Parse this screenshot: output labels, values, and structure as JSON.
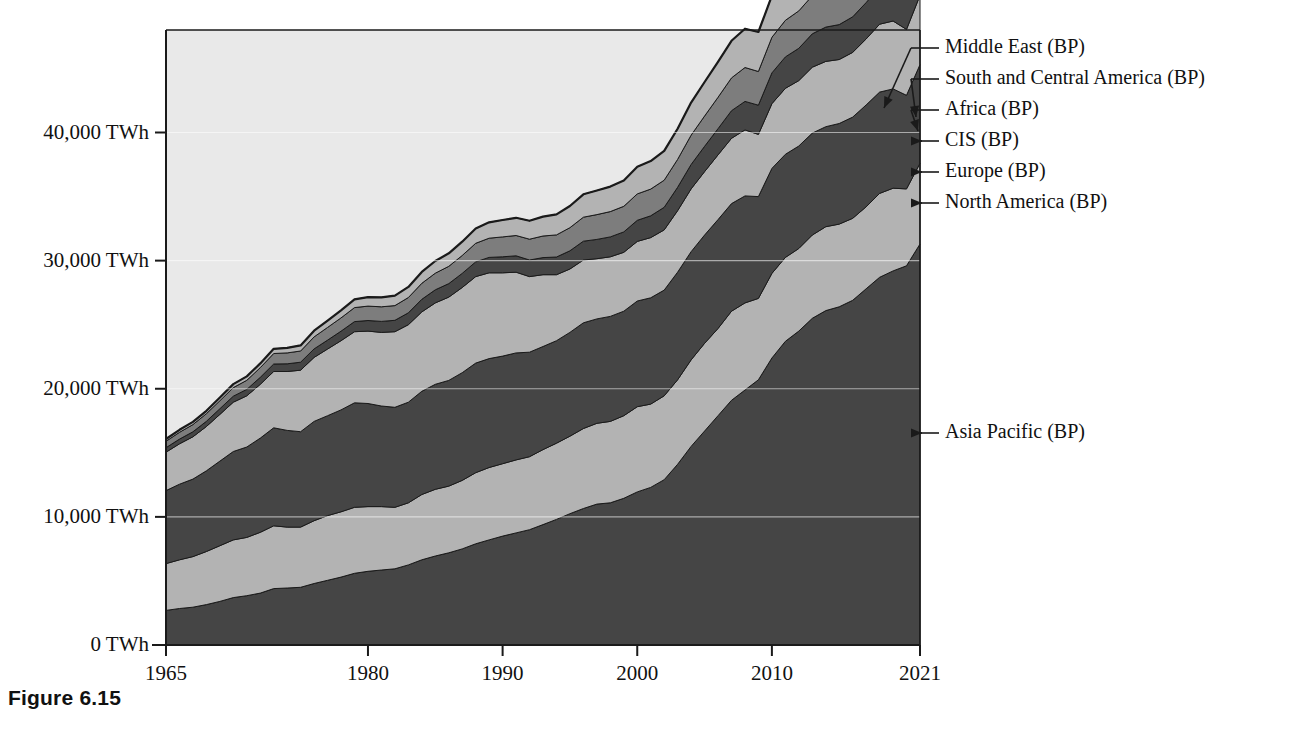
{
  "figure": {
    "caption": "Figure 6.15"
  },
  "axes": {
    "y_ticks": [
      {
        "label": "0 TWh",
        "value": 0
      },
      {
        "label": "10,000 TWh",
        "value": 10000
      },
      {
        "label": "20,000 TWh",
        "value": 20000
      },
      {
        "label": "30,000 TWh",
        "value": 30000
      },
      {
        "label": "40,000 TWh",
        "value": 40000
      }
    ],
    "x_ticks": [
      {
        "label": "1965",
        "value": 1965
      },
      {
        "label": "1980",
        "value": 1980
      },
      {
        "label": "1990",
        "value": 1990
      },
      {
        "label": "2000",
        "value": 2000
      },
      {
        "label": "2010",
        "value": 2010
      },
      {
        "label": "2021",
        "value": 2021
      }
    ]
  },
  "callouts": [
    {
      "id": "middle-east",
      "label": "Middle East (BP)"
    },
    {
      "id": "south-central-america",
      "label": "South and Central America (BP)"
    },
    {
      "id": "africa",
      "label": "Africa (BP)"
    },
    {
      "id": "cis",
      "label": "CIS (BP)"
    },
    {
      "id": "europe",
      "label": "Europe (BP)"
    },
    {
      "id": "north-america",
      "label": "North America (BP)"
    },
    {
      "id": "asia-pacific",
      "label": "Asia Pacific (BP)"
    }
  ],
  "colors": {
    "plot_background": "#e9e9e9",
    "dark_band": "#454545",
    "light_band": "#b3b3b3",
    "medium_band": "#7d7d7d",
    "outline": "#1a1a1a",
    "text": "#111111"
  },
  "chart_data": {
    "type": "area",
    "stacked": true,
    "title": "",
    "xlabel": "",
    "ylabel": "TWh",
    "xlim": [
      1965,
      2021
    ],
    "ylim": [
      0,
      48000
    ],
    "grid": false,
    "legend_position": "right-callouts",
    "units": "TWh",
    "x": [
      1965,
      1966,
      1967,
      1968,
      1969,
      1970,
      1971,
      1972,
      1973,
      1974,
      1975,
      1976,
      1977,
      1978,
      1979,
      1980,
      1981,
      1982,
      1983,
      1984,
      1985,
      1986,
      1987,
      1988,
      1989,
      1990,
      1991,
      1992,
      1993,
      1994,
      1995,
      1996,
      1997,
      1998,
      1999,
      2000,
      2001,
      2002,
      2003,
      2004,
      2005,
      2006,
      2007,
      2008,
      2009,
      2010,
      2011,
      2012,
      2013,
      2014,
      2015,
      2016,
      2017,
      2018,
      2019,
      2020,
      2021
    ],
    "series": [
      {
        "name": "Asia Pacific (BP)",
        "fill": "#454545",
        "values": [
          2700,
          2850,
          2950,
          3150,
          3400,
          3700,
          3850,
          4050,
          4400,
          4450,
          4500,
          4800,
          5050,
          5300,
          5600,
          5750,
          5850,
          5950,
          6250,
          6650,
          6950,
          7200,
          7500,
          7900,
          8200,
          8500,
          8750,
          9000,
          9400,
          9800,
          10250,
          10650,
          11000,
          11100,
          11450,
          11950,
          12300,
          12900,
          14100,
          15500,
          16700,
          17900,
          19100,
          19900,
          20700,
          22400,
          23700,
          24500,
          25500,
          26100,
          26400,
          26900,
          27800,
          28700,
          29200,
          29600,
          31300
        ]
      },
      {
        "name": "North America (BP)",
        "fill": "#b3b3b3",
        "values": [
          3650,
          3800,
          3950,
          4150,
          4350,
          4500,
          4550,
          4750,
          4900,
          4750,
          4700,
          4900,
          5050,
          5100,
          5150,
          5050,
          4950,
          4800,
          4850,
          5100,
          5200,
          5200,
          5350,
          5550,
          5650,
          5650,
          5700,
          5700,
          5850,
          5950,
          6050,
          6250,
          6300,
          6350,
          6450,
          6650,
          6500,
          6550,
          6600,
          6750,
          6850,
          6800,
          6950,
          6800,
          6350,
          6600,
          6550,
          6450,
          6500,
          6550,
          6450,
          6400,
          6400,
          6550,
          6450,
          6000,
          6300
        ]
      },
      {
        "name": "Europe (BP)",
        "fill": "#454545",
        "values": [
          5700,
          5900,
          6050,
          6300,
          6600,
          6900,
          7050,
          7350,
          7650,
          7550,
          7450,
          7750,
          7800,
          7950,
          8150,
          8050,
          7850,
          7800,
          7850,
          8050,
          8200,
          8250,
          8400,
          8550,
          8500,
          8400,
          8350,
          8150,
          8050,
          8000,
          8100,
          8250,
          8150,
          8200,
          8150,
          8250,
          8300,
          8250,
          8400,
          8450,
          8450,
          8500,
          8400,
          8350,
          7950,
          8200,
          8050,
          8000,
          7950,
          7800,
          7850,
          7900,
          7950,
          7900,
          7750,
          7300,
          7700
        ]
      },
      {
        "name": "CIS (BP)",
        "fill": "#b3b3b3",
        "values": [
          3000,
          3150,
          3300,
          3450,
          3650,
          3850,
          4000,
          4200,
          4400,
          4600,
          4800,
          5000,
          5200,
          5400,
          5550,
          5650,
          5750,
          5900,
          6050,
          6200,
          6350,
          6500,
          6650,
          6750,
          6700,
          6500,
          6300,
          5900,
          5600,
          5150,
          4950,
          4900,
          4700,
          4650,
          4600,
          4650,
          4700,
          4700,
          4800,
          4900,
          4950,
          5050,
          5100,
          5150,
          4850,
          5050,
          5150,
          5100,
          5150,
          5100,
          5000,
          5050,
          5150,
          5300,
          5300,
          5150,
          5400
        ]
      },
      {
        "name": "Africa (BP)",
        "fill": "#454545",
        "values": [
          350,
          370,
          390,
          410,
          440,
          470,
          500,
          540,
          580,
          600,
          620,
          660,
          700,
          740,
          790,
          830,
          860,
          890,
          930,
          980,
          1020,
          1060,
          1100,
          1150,
          1200,
          1250,
          1280,
          1300,
          1340,
          1380,
          1420,
          1470,
          1510,
          1550,
          1590,
          1650,
          1700,
          1760,
          1820,
          1900,
          1970,
          2050,
          2150,
          2230,
          2280,
          2400,
          2450,
          2520,
          2600,
          2680,
          2720,
          2780,
          2840,
          2900,
          2950,
          2900,
          3050
        ]
      },
      {
        "name": "South and Central America (BP)",
        "fill": "#7d7d7d",
        "values": [
          500,
          530,
          560,
          590,
          630,
          670,
          710,
          760,
          820,
          850,
          880,
          940,
          990,
          1040,
          1090,
          1120,
          1140,
          1150,
          1190,
          1250,
          1300,
          1350,
          1400,
          1450,
          1500,
          1550,
          1580,
          1620,
          1680,
          1730,
          1800,
          1870,
          1930,
          1980,
          2000,
          2060,
          2080,
          2120,
          2180,
          2290,
          2370,
          2450,
          2560,
          2640,
          2630,
          2780,
          2860,
          2920,
          2980,
          3030,
          3000,
          2950,
          3000,
          3050,
          3050,
          2880,
          3080
        ]
      },
      {
        "name": "Middle East (BP)",
        "fill": "#b3b3b3",
        "values": [
          180,
          195,
          210,
          230,
          250,
          275,
          300,
          330,
          370,
          400,
          430,
          480,
          530,
          590,
          650,
          700,
          740,
          780,
          830,
          890,
          950,
          1010,
          1080,
          1160,
          1240,
          1320,
          1380,
          1440,
          1520,
          1600,
          1690,
          1790,
          1880,
          1950,
          2010,
          2120,
          2190,
          2280,
          2400,
          2540,
          2650,
          2770,
          2900,
          3030,
          3080,
          3250,
          3380,
          3480,
          3580,
          3680,
          3720,
          3780,
          3850,
          3950,
          3980,
          3850,
          4050
        ]
      }
    ]
  }
}
